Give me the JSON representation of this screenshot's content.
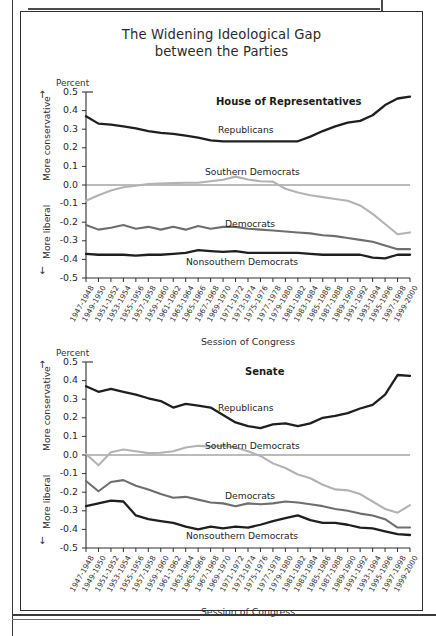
{
  "title": {
    "line1": "The Widening Ideological Gap",
    "line2": "between the Parties"
  },
  "axis": {
    "unit_label": "Percent",
    "y_top_label": "More conservative",
    "y_bottom_label": "More liberal",
    "x_title": "Session of Congress",
    "arrow_up": "↑",
    "arrow_down": "↓",
    "yticks": [
      "0.5",
      "0.4",
      "0.3",
      "0.2",
      "0.1",
      "0.0",
      "-0.1",
      "-0.2",
      "-0.3",
      "-0.4",
      "-0.5"
    ]
  },
  "colors": {
    "republicans": "#1f1f1f",
    "democrats": "#6e6e6e",
    "nonsouthern_democrats": "#1f1f1f",
    "southern_democrats": "#b3b3b3",
    "axis": "#2f2f2f",
    "zero_line": "#555555"
  },
  "panels": [
    {
      "name": "house",
      "title": "House of Representatives"
    },
    {
      "name": "senate",
      "title": "Senate"
    }
  ],
  "series_labels": {
    "republicans": "Republicans",
    "southern_democrats": "Southern Democrats",
    "democrats": "Democrats",
    "nonsouthern_democrats": "Nonsouthern Democrats"
  },
  "chart_data": [
    {
      "type": "line",
      "title": "House of Representatives",
      "xlabel": "Session of Congress",
      "ylabel": "Percent",
      "ylim": [
        -0.5,
        0.5
      ],
      "grid": false,
      "legend": "inline-annotations",
      "categories": [
        "1947-1948",
        "1949-1950",
        "1951-1952",
        "1953-1954",
        "1955-1956",
        "1957-1958",
        "1959-1960",
        "1961-1962",
        "1963-1964",
        "1965-1966",
        "1967-1968",
        "1969-1970",
        "1971-1972",
        "1973-1974",
        "1975-1976",
        "1977-1978",
        "1979-1980",
        "1981-1982",
        "1983-1984",
        "1985-1986",
        "1987-1988",
        "1989-1990",
        "1991-1992",
        "1993-1994",
        "1995-1996",
        "1997-1998",
        "1999-2000"
      ],
      "series": [
        {
          "name": "Republicans",
          "color": "#1f1f1f",
          "values": [
            0.37,
            0.33,
            0.325,
            0.315,
            0.305,
            0.29,
            0.28,
            0.275,
            0.265,
            0.255,
            0.24,
            0.235,
            0.235,
            0.235,
            0.235,
            0.235,
            0.235,
            0.235,
            0.26,
            0.29,
            0.315,
            0.335,
            0.345,
            0.375,
            0.43,
            0.465,
            0.475
          ]
        },
        {
          "name": "Southern Democrats",
          "color": "#b3b3b3",
          "values": [
            -0.085,
            -0.055,
            -0.03,
            -0.012,
            -0.004,
            0.005,
            0.008,
            0.01,
            0.012,
            0.012,
            0.02,
            0.028,
            0.045,
            0.03,
            0.02,
            0.018,
            -0.02,
            -0.04,
            -0.055,
            -0.065,
            -0.075,
            -0.085,
            -0.11,
            -0.155,
            -0.21,
            -0.265,
            -0.255
          ]
        },
        {
          "name": "Democrats",
          "color": "#6e6e6e",
          "values": [
            -0.215,
            -0.24,
            -0.23,
            -0.215,
            -0.235,
            -0.225,
            -0.24,
            -0.225,
            -0.24,
            -0.22,
            -0.235,
            -0.225,
            -0.225,
            -0.235,
            -0.24,
            -0.245,
            -0.25,
            -0.255,
            -0.26,
            -0.27,
            -0.275,
            -0.285,
            -0.295,
            -0.305,
            -0.325,
            -0.345,
            -0.345
          ]
        },
        {
          "name": "Nonsouthern Democrats",
          "color": "#1f1f1f",
          "values": [
            -0.37,
            -0.375,
            -0.375,
            -0.375,
            -0.38,
            -0.375,
            -0.375,
            -0.37,
            -0.365,
            -0.35,
            -0.355,
            -0.36,
            -0.355,
            -0.365,
            -0.365,
            -0.365,
            -0.365,
            -0.365,
            -0.37,
            -0.375,
            -0.375,
            -0.375,
            -0.375,
            -0.39,
            -0.395,
            -0.375,
            -0.375
          ]
        }
      ]
    },
    {
      "type": "line",
      "title": "Senate",
      "xlabel": "Session of Congress",
      "ylabel": "Percent",
      "ylim": [
        -0.5,
        0.5
      ],
      "grid": false,
      "legend": "inline-annotations",
      "categories": [
        "1947-1948",
        "1949-1950",
        "1951-1952",
        "1953-1954",
        "1955-1956",
        "1957-1958",
        "1959-1960",
        "1961-1962",
        "1963-1964",
        "1965-1966",
        "1967-1968",
        "1969-1970",
        "1971-1972",
        "1973-1974",
        "1975-1976",
        "1977-1978",
        "1979-1980",
        "1981-1982",
        "1983-1984",
        "1985-1986",
        "1987-1988",
        "1989-1990",
        "1991-1992",
        "1993-1994",
        "1995-1996",
        "1997-1998",
        "1999-2000"
      ],
      "series": [
        {
          "name": "Republicans",
          "color": "#1f1f1f",
          "values": [
            0.37,
            0.34,
            0.355,
            0.34,
            0.325,
            0.305,
            0.29,
            0.255,
            0.275,
            0.265,
            0.255,
            0.215,
            0.175,
            0.155,
            0.145,
            0.165,
            0.17,
            0.155,
            0.17,
            0.2,
            0.21,
            0.225,
            0.25,
            0.27,
            0.325,
            0.43,
            0.425
          ]
        },
        {
          "name": "Southern Democrats",
          "color": "#b3b3b3",
          "values": [
            0.005,
            -0.055,
            0.015,
            0.03,
            0.02,
            0.01,
            0.012,
            0.02,
            0.04,
            0.05,
            0.045,
            0.05,
            0.04,
            0.02,
            -0.005,
            -0.045,
            -0.07,
            -0.105,
            -0.125,
            -0.16,
            -0.185,
            -0.19,
            -0.21,
            -0.25,
            -0.29,
            -0.31,
            -0.27
          ]
        },
        {
          "name": "Democrats",
          "color": "#6e6e6e",
          "values": [
            -0.14,
            -0.195,
            -0.145,
            -0.135,
            -0.165,
            -0.185,
            -0.21,
            -0.23,
            -0.225,
            -0.24,
            -0.255,
            -0.26,
            -0.275,
            -0.26,
            -0.265,
            -0.26,
            -0.25,
            -0.255,
            -0.265,
            -0.275,
            -0.29,
            -0.3,
            -0.315,
            -0.325,
            -0.345,
            -0.39,
            -0.39
          ]
        },
        {
          "name": "Nonsouthern Democrats",
          "color": "#1f1f1f",
          "values": [
            -0.275,
            -0.26,
            -0.245,
            -0.25,
            -0.325,
            -0.345,
            -0.355,
            -0.365,
            -0.385,
            -0.4,
            -0.385,
            -0.395,
            -0.385,
            -0.39,
            -0.375,
            -0.355,
            -0.34,
            -0.325,
            -0.35,
            -0.365,
            -0.365,
            -0.375,
            -0.39,
            -0.395,
            -0.41,
            -0.425,
            -0.43
          ]
        }
      ]
    }
  ]
}
